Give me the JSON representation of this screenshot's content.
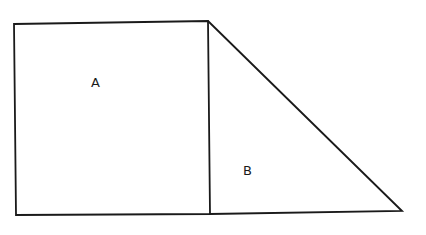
{
  "diagram": {
    "type": "geometry",
    "stroke_color": "#1a1a1a",
    "background": "#ffffff",
    "shapes": [
      {
        "id": "A",
        "kind": "rectangle",
        "label": "A",
        "points": [
          [
            14,
            24
          ],
          [
            208,
            21
          ],
          [
            210,
            214
          ],
          [
            16,
            215
          ]
        ],
        "label_pos": [
          95,
          87
        ]
      },
      {
        "id": "B",
        "kind": "right-triangle",
        "label": "B",
        "points": [
          [
            208,
            21
          ],
          [
            210,
            214
          ],
          [
            402,
            211
          ]
        ],
        "label_pos": [
          247,
          175
        ]
      }
    ]
  }
}
